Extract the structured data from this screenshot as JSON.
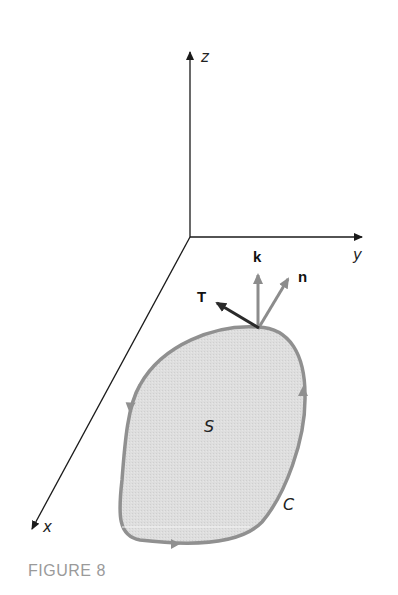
{
  "figure": {
    "caption": "FIGURE 8",
    "axes": {
      "x_label": "x",
      "y_label": "y",
      "z_label": "z"
    },
    "vectors": {
      "tangent_label": "T",
      "k_label": "k",
      "normal_label": "n"
    },
    "region": {
      "surface_label": "S",
      "curve_label": "C"
    },
    "colors": {
      "axis": "#1a1a1a",
      "surface_fill": "#dcdcdc",
      "curve_stroke": "#909090",
      "vector_gray": "#8c8c8c",
      "tangent_vector": "#2a2a2a",
      "caption": "#9a9a9a"
    }
  }
}
